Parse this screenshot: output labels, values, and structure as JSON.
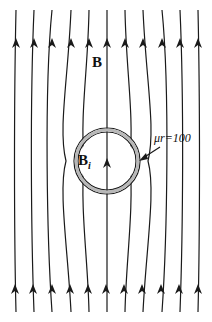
{
  "figure": {
    "field_label": "B",
    "inner_field_label": "B",
    "inner_field_subscript": "i",
    "permeability_label": "μr=100",
    "colors": {
      "line": "#1a1a1a",
      "shell": "#b8b8b8",
      "background": "#ffffff"
    }
  }
}
